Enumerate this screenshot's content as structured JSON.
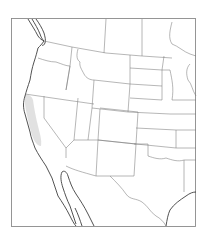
{
  "map": {
    "title": "",
    "region": "Western and Central United States with northern Mexico",
    "style": "outline map, black and white",
    "colors": {
      "background": "#ffffff",
      "frame": "#8a8a8a",
      "state_lines": "#7a7a7a",
      "coastline": "#3e3e3e",
      "highlight": "#dcdcdc"
    },
    "highlighted_region": "California Central Valley (light gray stipple)",
    "labels": []
  }
}
